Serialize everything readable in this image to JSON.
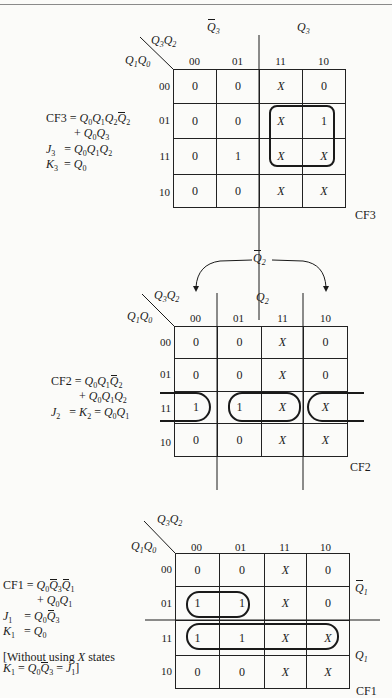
{
  "maps": [
    {
      "id": "cf3",
      "name": "CF3",
      "corner": {
        "cols_var": "Q3Q2",
        "rows_var": "Q1Q0"
      },
      "region_labels": [
        {
          "text": "Q̄3",
          "side": "top-left"
        },
        {
          "text": "Q3",
          "side": "top-right"
        }
      ],
      "col_headers": [
        "00",
        "01",
        "11",
        "10"
      ],
      "row_headers": [
        "00",
        "01",
        "11",
        "10"
      ],
      "cells": [
        [
          "0",
          "0",
          "X",
          "0"
        ],
        [
          "0",
          "0",
          "X",
          "1"
        ],
        [
          "0",
          "1",
          "X",
          "X"
        ],
        [
          "0",
          "0",
          "X",
          "X"
        ]
      ],
      "equations": [
        "CF3 = Q0Q1Q2Q̄2",
        "+ Q0Q3",
        "J3 = Q0Q1Q2",
        "K3 = Q0"
      ],
      "groupings": [
        "cols 11-10, rows 01-11"
      ]
    },
    {
      "id": "cf2",
      "name": "CF2",
      "corner": {
        "cols_var": "Q3Q2",
        "rows_var": "Q1Q0"
      },
      "region_labels": [
        {
          "text": "Q̄2",
          "side": "top-arc"
        },
        {
          "text": "Q2",
          "side": "top-middle"
        }
      ],
      "col_headers": [
        "00",
        "01",
        "11",
        "10"
      ],
      "row_headers": [
        "00",
        "01",
        "11",
        "10"
      ],
      "cells": [
        [
          "0",
          "0",
          "X",
          "0"
        ],
        [
          "0",
          "0",
          "X",
          "0"
        ],
        [
          "1",
          "1",
          "X",
          "X"
        ],
        [
          "0",
          "0",
          "X",
          "X"
        ]
      ],
      "equations": [
        "CF2 = Q0Q1Q̄2",
        "+ Q0Q1Q2",
        "J2 = K2 = Q0Q1"
      ],
      "groupings": [
        "row 11 wrap cols 00+10",
        "row 11 cols 01-11"
      ]
    },
    {
      "id": "cf1",
      "name": "CF1",
      "corner": {
        "cols_var": "Q3Q2",
        "rows_var": "Q1Q0"
      },
      "region_labels": [
        {
          "text": "Q̄1",
          "side": "right-upper"
        },
        {
          "text": "Q1",
          "side": "right-lower"
        }
      ],
      "col_headers": [
        "00",
        "01",
        "11",
        "10"
      ],
      "row_headers": [
        "00",
        "01",
        "11",
        "10"
      ],
      "cells": [
        [
          "0",
          "0",
          "X",
          "0"
        ],
        [
          "1",
          "1",
          "X",
          "0"
        ],
        [
          "1",
          "1",
          "X",
          "X"
        ],
        [
          "0",
          "0",
          "X",
          "X"
        ]
      ],
      "equations": [
        "CF1 = Q0Q̄3Q̄1",
        "+ Q0Q1",
        "J1 = Q0Q̄3",
        "K1 = Q0"
      ],
      "note": [
        "[Without using X states",
        "K1 = Q0Q̄3 = J1]"
      ],
      "groupings": [
        "row 01 cols 00-01",
        "row 11 cols 00-10"
      ]
    }
  ]
}
